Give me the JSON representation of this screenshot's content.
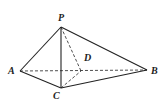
{
  "diagram": {
    "type": "pyramid",
    "colors": {
      "line": "#222222",
      "background": "#ffffff"
    },
    "vertices": {
      "P": {
        "label": "P",
        "x": 61,
        "y": 27,
        "lx": 58,
        "ly": 21
      },
      "A": {
        "label": "A",
        "x": 20,
        "y": 71,
        "lx": 8,
        "ly": 74
      },
      "B": {
        "label": "B",
        "x": 147,
        "y": 70,
        "lx": 151,
        "ly": 74
      },
      "C": {
        "label": "C",
        "x": 61,
        "y": 88,
        "lx": 53,
        "ly": 99
      },
      "D": {
        "label": "D",
        "x": 81,
        "y": 71,
        "lx": 84,
        "ly": 61
      }
    },
    "solid_edges": [
      "PA",
      "PB",
      "PC",
      "AC",
      "CB"
    ],
    "dashed_edges": [
      "AB",
      "PD",
      "CD"
    ]
  }
}
